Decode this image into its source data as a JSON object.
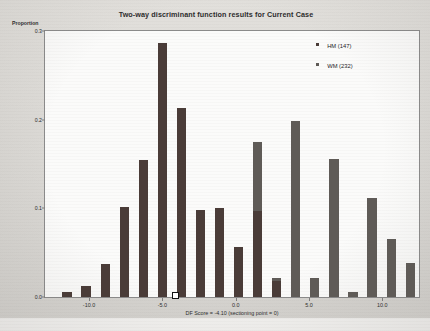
{
  "chart_data": {
    "type": "bar",
    "title": "Two-way discriminant function results for Current Case",
    "xlabel": "DF Score = -4.10 (sectioning point = 0)",
    "ylabel": "Proportion",
    "xlim": [
      -13.0,
      12.5
    ],
    "ylim": [
      0.0,
      0.3
    ],
    "grid": false,
    "legend_position": "top-right",
    "x_ticks": [
      "-10.0",
      "-5.0",
      "0.0",
      "5.0",
      "10.0"
    ],
    "x_tick_values": [
      -10.0,
      -5.0,
      0.0,
      5.0,
      10.0
    ],
    "y_ticks": [
      "0.0",
      "0.1",
      "0.2",
      "0.3"
    ],
    "y_tick_values": [
      0.0,
      0.1,
      0.2,
      0.3
    ],
    "annotations": [
      {
        "name": "sectioning-point-marker",
        "label": "DF Score = -4.10",
        "x": -4.1,
        "y": 0.0
      }
    ],
    "series": [
      {
        "name": "HM (147)",
        "color": "#4a3c38",
        "x": [
          -11.5,
          -10.2,
          -8.9,
          -7.6,
          -6.3,
          -5.0,
          -3.7,
          -2.4,
          -1.1,
          0.2,
          1.5,
          2.8
        ],
        "values": [
          0.006,
          0.012,
          0.037,
          0.101,
          0.155,
          0.286,
          0.213,
          0.098,
          0.1,
          0.056,
          0.097,
          0.018
        ]
      },
      {
        "name": "WM (232)",
        "color": "#5f5b57",
        "x": [
          -6.3,
          -5.0,
          -3.7,
          -2.4,
          -1.1,
          0.2,
          1.5,
          2.8,
          4.1,
          5.4,
          6.7,
          8.0,
          9.3,
          10.6,
          11.9
        ],
        "values": [
          0.011,
          0.024,
          0.064,
          0.031,
          0.095,
          0.045,
          0.175,
          0.021,
          0.198,
          0.022,
          0.156,
          0.006,
          0.112,
          0.065,
          0.038
        ]
      }
    ]
  },
  "legend": {
    "items": [
      {
        "label": "HM (147)",
        "color": "#4a3c38"
      },
      {
        "label": "WM (232)",
        "color": "#5f5b57"
      }
    ]
  }
}
